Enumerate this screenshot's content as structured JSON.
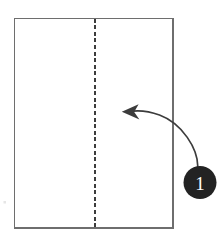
{
  "canvas": {
    "width": 224,
    "height": 239,
    "background": "#ffffff"
  },
  "diagram": {
    "type": "origami-instruction",
    "paper_sheet": {
      "name": "paper-sheet",
      "shape": "rectangle",
      "x": 14.5,
      "y": 18.5,
      "width": 158.5,
      "height": 209.5,
      "stroke": "#6e6e6e",
      "stroke_width": 1.6,
      "fill": "#ffffff"
    },
    "fold_line": {
      "name": "vertical-fold-line",
      "style": "dashed",
      "x": 94.5,
      "y_start": 18.5,
      "y_end": 228,
      "stroke": "#3c3c3c",
      "stroke_width": 2,
      "dash_pattern": "4 2.6"
    },
    "fold_arrow": {
      "name": "fold-direction-arrow",
      "path": "M 197.5 166.5 C 197.5 150 183 124 160 115.5 C 148 111 136 110.5 128.5 111.5",
      "stroke": "#3c3c3c",
      "stroke_width": 1.7,
      "arrowhead_points": "122.5,112.5 137.5,105.5 134.5,112.2 138.5,119.5",
      "arrowhead_fill": "#3c3c3c",
      "direction": "right-to-left"
    },
    "step_badge": {
      "name": "step-number-badge",
      "label": "1",
      "cx": 200,
      "cy": 182.5,
      "r": 16.5,
      "fill": "#232323",
      "text_color": "#ffffff"
    },
    "stray_mark": {
      "name": "stray-speck",
      "x": 3.5,
      "y": 201,
      "width": 2.5,
      "height": 2.5,
      "fill": "#e4e4e4"
    }
  }
}
